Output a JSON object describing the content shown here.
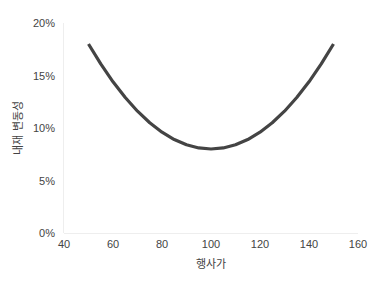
{
  "chart_data": {
    "type": "line",
    "title": "",
    "xlabel": "행사가",
    "ylabel": "내재 변동성",
    "xlim": [
      40,
      160
    ],
    "ylim": [
      0,
      0.2
    ],
    "x_ticks": [
      40,
      60,
      80,
      100,
      120,
      140,
      160
    ],
    "y_ticks": [
      0,
      0.05,
      0.1,
      0.15,
      0.2
    ],
    "y_tick_labels": [
      "0%",
      "5%",
      "10%",
      "15%",
      "20%"
    ],
    "grid": false,
    "legend": null,
    "series": [
      {
        "name": "내재 변동성 스마일",
        "color": "#444444",
        "x": [
          50,
          55,
          60,
          65,
          70,
          75,
          80,
          85,
          90,
          95,
          100,
          105,
          110,
          115,
          120,
          125,
          130,
          135,
          140,
          145,
          150
        ],
        "values": [
          0.18,
          0.161,
          0.144,
          0.129,
          0.116,
          0.105,
          0.096,
          0.089,
          0.084,
          0.081,
          0.08,
          0.081,
          0.084,
          0.089,
          0.096,
          0.105,
          0.116,
          0.129,
          0.144,
          0.161,
          0.18
        ]
      }
    ]
  }
}
